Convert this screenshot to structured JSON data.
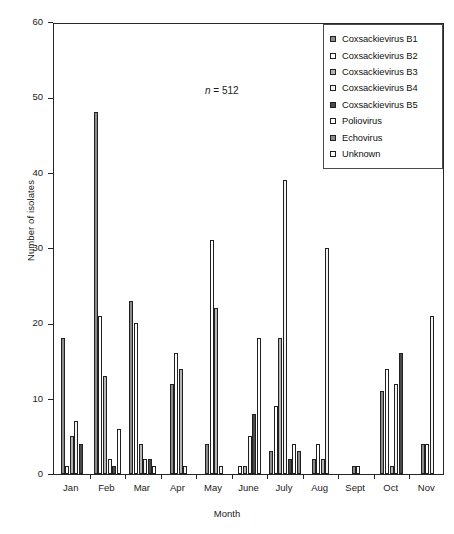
{
  "chart_data": {
    "type": "bar",
    "title": "",
    "xlabel": "Month",
    "ylabel": "Number of isolates",
    "ylim": [
      0,
      60
    ],
    "yticks": [
      0,
      10,
      20,
      30,
      40,
      50,
      60
    ],
    "grid": false,
    "legend_position": "top-right",
    "annotation": "n = 512",
    "annotation_n_symbol": "n",
    "annotation_value": "= 512",
    "categories": [
      "Jan",
      "Feb",
      "Mar",
      "Apr",
      "May",
      "June",
      "July",
      "Aug",
      "Sept",
      "Oct",
      "Nov"
    ],
    "series": [
      {
        "name": "Coxsackievirus B1",
        "color": "#8c8c8c",
        "values": [
          18,
          48,
          23,
          12,
          4,
          0,
          3,
          2,
          1,
          11,
          4
        ]
      },
      {
        "name": "Coxsackievirus B2",
        "color": "#ffffff",
        "values": [
          1,
          21,
          20,
          16,
          31,
          1,
          9,
          4,
          1,
          14,
          4
        ]
      },
      {
        "name": "Coxsackievirus B3",
        "color": "#b5b5b5",
        "values": [
          5,
          13,
          4,
          14,
          22,
          1,
          18,
          2,
          0,
          1,
          0
        ]
      },
      {
        "name": "Coxsackievirus B4",
        "color": "#f2f2f2",
        "values": [
          7,
          2,
          2,
          1,
          1,
          5,
          39,
          30,
          0,
          12,
          21
        ]
      },
      {
        "name": "Coxsackievirus B5",
        "color": "#4a4a4a",
        "values": [
          4,
          1,
          2,
          0,
          0,
          8,
          2,
          0,
          0,
          16,
          0
        ]
      },
      {
        "name": "Poliovirus",
        "color": "#ffffff",
        "values": [
          0,
          6,
          1,
          0,
          0,
          18,
          4,
          0,
          0,
          0,
          0
        ]
      },
      {
        "name": "Echovirus",
        "color": "#8c8c8c",
        "values": [
          0,
          0,
          0,
          0,
          0,
          0,
          3,
          0,
          0,
          0,
          0
        ]
      },
      {
        "name": "Unknown",
        "color": "#ffffff",
        "values": [
          0,
          0,
          0,
          0,
          0,
          0,
          0,
          0,
          0,
          0,
          0
        ]
      }
    ]
  },
  "legend": {
    "items": [
      {
        "label": "Coxsackievirus B1",
        "swatch": "#8c8c8c"
      },
      {
        "label": "Coxsackievirus B2",
        "swatch": "#ffffff"
      },
      {
        "label": "Coxsackievirus B3",
        "swatch": "#b5b5b5"
      },
      {
        "label": "Coxsackievirus B4",
        "swatch": "#f2f2f2"
      },
      {
        "label": "Coxsackievirus B5",
        "swatch": "#4a4a4a"
      },
      {
        "label": "Poliovirus",
        "swatch": "#ffffff"
      },
      {
        "label": "Echovirus",
        "swatch": "#8c8c8c"
      },
      {
        "label": "Unknown",
        "swatch": "#ffffff"
      }
    ]
  },
  "axes": {
    "y_title": "Number of isolates",
    "x_title": "Month",
    "y_tick_labels": [
      "0",
      "10",
      "20",
      "30",
      "40",
      "50",
      "60"
    ],
    "x_tick_labels": [
      "Jan",
      "Feb",
      "Mar",
      "Apr",
      "May",
      "June",
      "July",
      "Aug",
      "Sept",
      "Oct",
      "Nov"
    ]
  }
}
